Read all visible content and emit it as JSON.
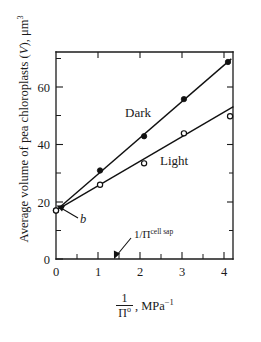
{
  "figure": {
    "background_color": "#ffffff",
    "ink_color": "#111111"
  },
  "chart_data": {
    "type": "scatter",
    "title": "",
    "subtitle": "",
    "xlabel": "1/Π°, MPa⁻¹",
    "ylabel": "Average volume of pea chloroplasts (V), μm³",
    "xlim": [
      0,
      4.22
    ],
    "ylim": [
      0,
      72.5
    ],
    "grid": false,
    "legend_position": "inline-annotation",
    "xticks": [
      0,
      1,
      2,
      3,
      4
    ],
    "xtick_labels": [
      "0",
      "1",
      "2",
      "3",
      "4"
    ],
    "xticks_minor": [
      0.5,
      1.5,
      2.5,
      3.5
    ],
    "yticks": [
      0,
      20,
      40,
      60
    ],
    "ytick_labels": [
      "0",
      "20",
      "40",
      "60"
    ],
    "yticks_minor": [
      10,
      30,
      50,
      70
    ],
    "series": [
      {
        "name": "Dark",
        "marker": "filled-circle",
        "x": [
          0,
          1.05,
          2.1,
          3.05,
          4.1
        ],
        "y": [
          17,
          31,
          43,
          56,
          69
        ],
        "fit_line": {
          "intercept": 17,
          "slope": 12.7
        }
      },
      {
        "name": "Light",
        "marker": "open-circle",
        "x": [
          0,
          1.05,
          2.1,
          3.05,
          4.15
        ],
        "y": [
          17,
          26,
          33.5,
          44,
          50
        ],
        "fit_line": {
          "intercept": 17,
          "slope": 8.6
        }
      }
    ],
    "annotations": [
      {
        "id": "dark-series-label",
        "text": "Dark",
        "x": 1.55,
        "y": 47
      },
      {
        "id": "light-series-label",
        "text": "Light",
        "x": 2.45,
        "y": 30
      },
      {
        "id": "intercept-label",
        "text": "b",
        "style": "italic",
        "points_to_x": 0,
        "points_to_y": 17
      },
      {
        "id": "cell-sap-label",
        "text_base": "1/Π",
        "text_sup": "cell sap",
        "points_to_x": 1.45,
        "points_to_y": 0
      }
    ]
  },
  "axis_titles": {
    "y_prefix": "Average volume of pea chloroplasts (",
    "y_italic": "V",
    "y_suffix": "), μm",
    "y_sup": "3",
    "x_num": "1",
    "x_den": "Π",
    "x_den_sup": "o",
    "x_unit": ", MPa",
    "x_unit_sup": "−1"
  },
  "series_labels": {
    "dark": "Dark",
    "light": "Light"
  },
  "annotation_text": {
    "intercept": "b",
    "cell_sap_base": "1/Π",
    "cell_sap_sup": "cell sap"
  },
  "tick_text": {
    "x0": "0",
    "x1": "1",
    "x2": "2",
    "x3": "3",
    "x4": "4",
    "y0": "0",
    "y20": "20",
    "y40": "40",
    "y60": "60"
  }
}
